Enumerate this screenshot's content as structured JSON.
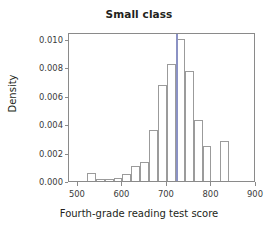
{
  "chart_data": {
    "type": "bar",
    "title": "Small class",
    "xlabel": "Fourth-grade reading test score",
    "ylabel": "Density",
    "xlim": [
      480,
      900
    ],
    "ylim": [
      0.0,
      0.0105
    ],
    "grid": false,
    "legend": null,
    "bin_width": 20,
    "xticks": [
      500,
      600,
      700,
      800,
      900
    ],
    "xtick_labels": [
      "500",
      "600",
      "700",
      "800",
      "900"
    ],
    "yticks": [
      0.0,
      0.002,
      0.004,
      0.006,
      0.008,
      0.01
    ],
    "ytick_labels": [
      "0.000",
      "0.002",
      "0.004",
      "0.006",
      "0.008",
      "0.010"
    ],
    "bins": [
      {
        "left": 520,
        "right": 540,
        "density": 0.00057
      },
      {
        "left": 540,
        "right": 560,
        "density": 0.00016
      },
      {
        "left": 560,
        "right": 580,
        "density": 0.00014
      },
      {
        "left": 580,
        "right": 600,
        "density": 0.00021
      },
      {
        "left": 600,
        "right": 620,
        "density": 0.00051
      },
      {
        "left": 620,
        "right": 640,
        "density": 0.00103
      },
      {
        "left": 640,
        "right": 660,
        "density": 0.00134
      },
      {
        "left": 660,
        "right": 680,
        "density": 0.00362
      },
      {
        "left": 680,
        "right": 700,
        "density": 0.00679
      },
      {
        "left": 700,
        "right": 720,
        "density": 0.00826
      },
      {
        "left": 720,
        "right": 740,
        "density": 0.01003
      },
      {
        "left": 740,
        "right": 760,
        "density": 0.00772
      },
      {
        "left": 760,
        "right": 780,
        "density": 0.00432
      },
      {
        "left": 780,
        "right": 800,
        "density": 0.00246
      },
      {
        "left": 800,
        "right": 820,
        "density": 0.0
      },
      {
        "left": 820,
        "right": 840,
        "density": 0.00281
      }
    ],
    "annotations": [
      {
        "name": "mean-reference-line",
        "type": "vline",
        "x": 722,
        "color": "#8b92c4"
      }
    ],
    "colors": {
      "bar_edge": "#9b9b9b",
      "bar_fill": "none",
      "axis": "#8a8a8a",
      "text": "#231f20",
      "vline": "#8b92c4"
    }
  }
}
